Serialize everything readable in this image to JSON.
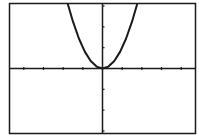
{
  "chart_data": {
    "type": "line",
    "title": "",
    "xlabel": "",
    "ylabel": "",
    "function": "y = x^2",
    "grid": false,
    "legend": null,
    "xlim": [
      -4.7,
      4.7
    ],
    "ylim": [
      -3.1,
      3.1
    ],
    "x_ticks_each_side": 4,
    "y_ticks_above": 3,
    "y_ticks_below": 3,
    "series": [
      {
        "name": "Y1",
        "x": [
          -1.8,
          -1.5,
          -1.2,
          -0.9,
          -0.6,
          -0.3,
          0,
          0.3,
          0.6,
          0.9,
          1.2,
          1.5,
          1.8
        ],
        "values": [
          3.24,
          2.25,
          1.44,
          0.81,
          0.36,
          0.09,
          0,
          0.09,
          0.36,
          0.81,
          1.44,
          2.25,
          3.24
        ]
      }
    ]
  },
  "colors": {
    "background": "#ffffff",
    "ink": "#1a1a1a"
  }
}
